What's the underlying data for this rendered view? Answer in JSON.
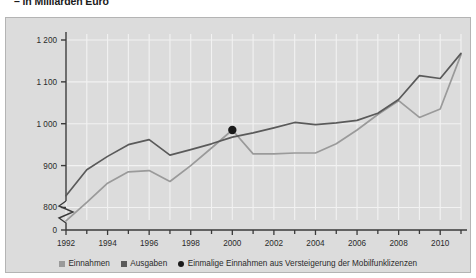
{
  "subtitle": "– in Milliarden Euro",
  "legend": [
    {
      "label": "Einnahmen",
      "marker": "square-swatch",
      "color": "#9a9a9a"
    },
    {
      "label": "Ausgaben",
      "marker": "square-swatch",
      "color": "#5a5a5a"
    },
    {
      "label": "Einmalige Einnahmen aus Versteigerung der Mobilfunklizenzen",
      "marker": "dot-marker",
      "color": "#1a1a1a"
    }
  ],
  "chart_data": {
    "type": "line",
    "title": "",
    "subtitle": "– in Milliarden Euro",
    "xlabel": "",
    "ylabel": "",
    "unit": "Milliarden Euro",
    "x": [
      1992,
      1993,
      1994,
      1995,
      1996,
      1997,
      1998,
      1999,
      2000,
      2001,
      2002,
      2003,
      2004,
      2005,
      2006,
      2007,
      2008,
      2009,
      2010,
      2011
    ],
    "tick_labels_x": [
      "1992",
      "1994",
      "1996",
      "1998",
      "2000",
      "2002",
      "2004",
      "2006",
      "2008",
      "2010"
    ],
    "tick_values_y": [
      0,
      800,
      900,
      1000,
      1100,
      1200
    ],
    "tick_labels_y": [
      "0",
      "800",
      "900",
      "1 000",
      "1 100",
      "1 200"
    ],
    "ylim": [
      770,
      1200
    ],
    "axis_break": true,
    "grid": true,
    "legend_position": "bottom",
    "series": [
      {
        "name": "Einnahmen",
        "color": "#9a9a9a",
        "values": [
          768,
          812,
          858,
          885,
          888,
          862,
          900,
          942,
          985,
          928,
          928,
          930,
          930,
          952,
          985,
          1022,
          1055,
          1015,
          1035,
          1165
        ]
      },
      {
        "name": "Ausgaben",
        "color": "#5a5a5a",
        "values": [
          828,
          890,
          922,
          950,
          962,
          925,
          938,
          952,
          968,
          978,
          990,
          1003,
          998,
          1002,
          1008,
          1025,
          1058,
          1115,
          1108,
          1168
        ]
      }
    ],
    "annotations": [
      {
        "name": "Einmalige Einnahmen aus Versteigerung der Mobilfunklizenzen",
        "x": 2000,
        "y": 985,
        "marker": "filled-circle",
        "color": "#1a1a1a"
      }
    ]
  },
  "colors": {
    "panel_background": "#dcdcdc",
    "panel_border": "#b4b4b4",
    "grid": "#f2f2f2",
    "axis": "#3a3a3a",
    "einnahmen": "#9a9a9a",
    "ausgaben": "#5a5a5a",
    "marker": "#1a1a1a"
  }
}
